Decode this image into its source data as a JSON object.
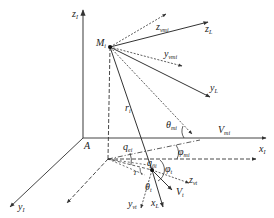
{
  "diagram": {
    "type": "3d-coordinate-geometry",
    "colors": {
      "line": "#333333",
      "axis": "#555555",
      "background": "#ffffff"
    },
    "points": {
      "origin": {
        "label": "A"
      },
      "missile": {
        "label": "M",
        "sub": "i"
      }
    },
    "axes": {
      "z_inertial": {
        "label": "z",
        "sub": "I"
      },
      "x_inertial": {
        "label": "x",
        "sub": "I"
      },
      "y_inertial": {
        "label": "y",
        "sub": "I"
      }
    },
    "vectors": {
      "z_vmi": {
        "label": "z",
        "sub": "vmi"
      },
      "z_L": {
        "label": "z",
        "sub": "L"
      },
      "y_vmi": {
        "label": "y",
        "sub": "vmi"
      },
      "y_L": {
        "label": "y",
        "sub": "L"
      },
      "V_mi": {
        "label": "V",
        "sub": "mi"
      },
      "r_i": {
        "label": "r",
        "sub": "i"
      },
      "x_L": {
        "label": "x",
        "sub": "L"
      },
      "V_t": {
        "label": "V",
        "sub": "t"
      },
      "z_vt": {
        "label": "z",
        "sub": "vt"
      },
      "y_vt": {
        "label": "y",
        "sub": "vt"
      }
    },
    "angles": {
      "theta_mi": {
        "label": "θ",
        "sub": "mi"
      },
      "phi_mi": {
        "label": "φ",
        "sub": "mi"
      },
      "q_ei": {
        "label": "q",
        "sub": "ei"
      },
      "q_beta": {
        "label": "q",
        "sub": "βi"
      },
      "phi_t": {
        "label": "φ",
        "sub": "t"
      },
      "theta_t": {
        "label": "θ",
        "sub": "t"
      },
      "T": {
        "label": "T"
      }
    }
  }
}
